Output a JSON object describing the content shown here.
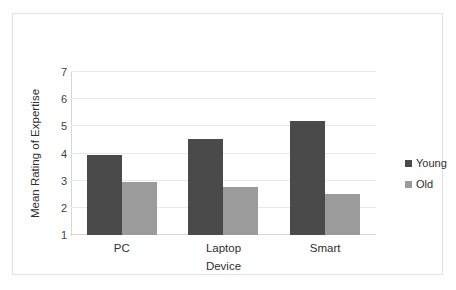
{
  "chart_data": {
    "type": "bar",
    "title": "",
    "subtitle": "",
    "xlabel": "Device",
    "ylabel": "Mean Rating of Expertise",
    "categories": [
      "PC",
      "Laptop",
      "Smart"
    ],
    "series": [
      {
        "name": "Young",
        "color": "#4a4a4a",
        "values": [
          3.93,
          4.55,
          5.2
        ]
      },
      {
        "name": "Old",
        "color": "#9b9b9b",
        "values": [
          2.95,
          2.78,
          2.5
        ]
      }
    ],
    "ylim": [
      1,
      7
    ],
    "yticks": [
      1,
      2,
      3,
      4,
      5,
      6,
      7
    ],
    "ytick_labels": [
      "1",
      "2",
      "3",
      "4",
      "5",
      "6",
      "7"
    ],
    "grid": true,
    "grid_axis": "y",
    "legend_position": "right",
    "bar_mode": "grouped"
  },
  "axes": {
    "y_title": "Mean Rating of Expertise",
    "x_title": "Device"
  },
  "legend": {
    "entries": [
      {
        "label": "Young",
        "swatch_color": "#4a4a4a"
      },
      {
        "label": "Old",
        "swatch_color": "#9b9b9b"
      }
    ]
  },
  "style": {
    "background": "#ffffff",
    "frame_border": "#e2e2e2",
    "gridline_color": "#e9e9e9",
    "axis_color": "#d6d6d6",
    "text_color": "#2e2e2e"
  }
}
